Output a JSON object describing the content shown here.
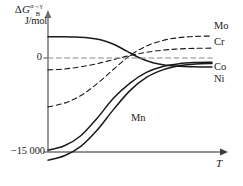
{
  "chart_data": {
    "type": "line",
    "title": "",
    "ylabel": "J/mol",
    "ylabel_symbol": "ΔG",
    "ylabel_superscript": "α→γ",
    "ylabel_subscript": "B",
    "xlabel": "T",
    "ytick_labels": [
      "0",
      "−15 000"
    ],
    "ytick_values": [
      0,
      -15000
    ],
    "ylim": [
      -17000,
      5000
    ],
    "xlim": [
      0,
      1
    ],
    "grid": false,
    "legend_position": "right-of-axes",
    "annotations": [
      "Mn"
    ],
    "series": [
      {
        "name": "Ni",
        "style": "solid",
        "label_side": "right",
        "x": [
          0.0,
          0.08,
          0.16,
          0.24,
          0.32,
          0.4,
          0.48,
          0.56,
          0.64,
          0.72,
          0.8,
          0.88,
          0.96,
          1.0
        ],
        "y": [
          3400,
          3390,
          3350,
          3230,
          2900,
          2200,
          1100,
          0,
          -750,
          -1150,
          -1330,
          -1400,
          -1430,
          -1440
        ]
      },
      {
        "name": "Co",
        "style": "solid",
        "label_side": "right",
        "x": [
          0.0,
          0.1,
          0.2,
          0.3,
          0.4,
          0.5,
          0.6,
          0.7,
          0.8,
          0.9,
          1.0
        ],
        "y": [
          -14700,
          -14000,
          -12400,
          -9600,
          -6400,
          -4000,
          -2300,
          -1350,
          -900,
          -730,
          -680
        ]
      },
      {
        "name": "Mn",
        "style": "solid",
        "label_side": "inline",
        "x": [
          0.0,
          0.1,
          0.2,
          0.3,
          0.4,
          0.5,
          0.6,
          0.7,
          0.8,
          0.9,
          1.0
        ],
        "y": [
          -16300,
          -15600,
          -14100,
          -11500,
          -8200,
          -5200,
          -3100,
          -1900,
          -1250,
          -950,
          -870
        ]
      },
      {
        "name": "Cr",
        "style": "dashed",
        "label_side": "right",
        "x": [
          0.0,
          0.1,
          0.2,
          0.3,
          0.4,
          0.5,
          0.6,
          0.7,
          0.8,
          0.9,
          1.0
        ],
        "y": [
          -1900,
          -1750,
          -1400,
          -900,
          -250,
          400,
          900,
          1250,
          1450,
          1540,
          1570
        ]
      },
      {
        "name": "Mo",
        "style": "dashed",
        "label_side": "right",
        "x": [
          0.0,
          0.1,
          0.2,
          0.3,
          0.4,
          0.5,
          0.6,
          0.7,
          0.8,
          0.9,
          1.0
        ],
        "y": [
          -7800,
          -7200,
          -6000,
          -4100,
          -1800,
          400,
          1900,
          2800,
          3250,
          3450,
          3500
        ]
      },
      {
        "name": "zero-reference",
        "style": "dashed",
        "label_side": "none",
        "x": [
          0.0,
          1.0
        ],
        "y": [
          0,
          0
        ]
      }
    ]
  },
  "labels": {
    "Mo": "Mo",
    "Cr": "Cr",
    "Co": "Co",
    "Ni": "Ni",
    "Mn": "Mn",
    "zero": "0",
    "bottom": "−15 000",
    "xaxis": "T",
    "yaxis_units": "J/mol",
    "yaxis_delta": "Δ",
    "yaxis_g": "G",
    "yaxis_sup": "α→γ",
    "yaxis_sub": "B"
  }
}
